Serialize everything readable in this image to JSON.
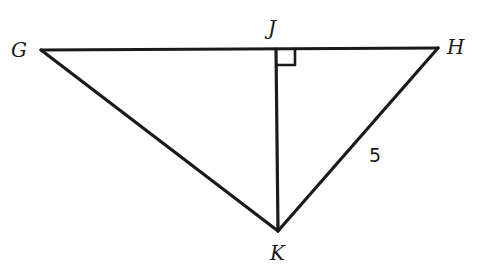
{
  "diagram": {
    "type": "geometry-triangle",
    "vertices": {
      "G": {
        "label": "G"
      },
      "H": {
        "label": "H"
      },
      "J": {
        "label": "J"
      },
      "K": {
        "label": "K"
      }
    },
    "segments": [
      "GH",
      "GK",
      "HK",
      "JK"
    ],
    "right_angle_at": "J",
    "side_labels": {
      "HK": "5"
    }
  },
  "colors": {
    "stroke": "#1a1a1a",
    "background": "#ffffff"
  }
}
